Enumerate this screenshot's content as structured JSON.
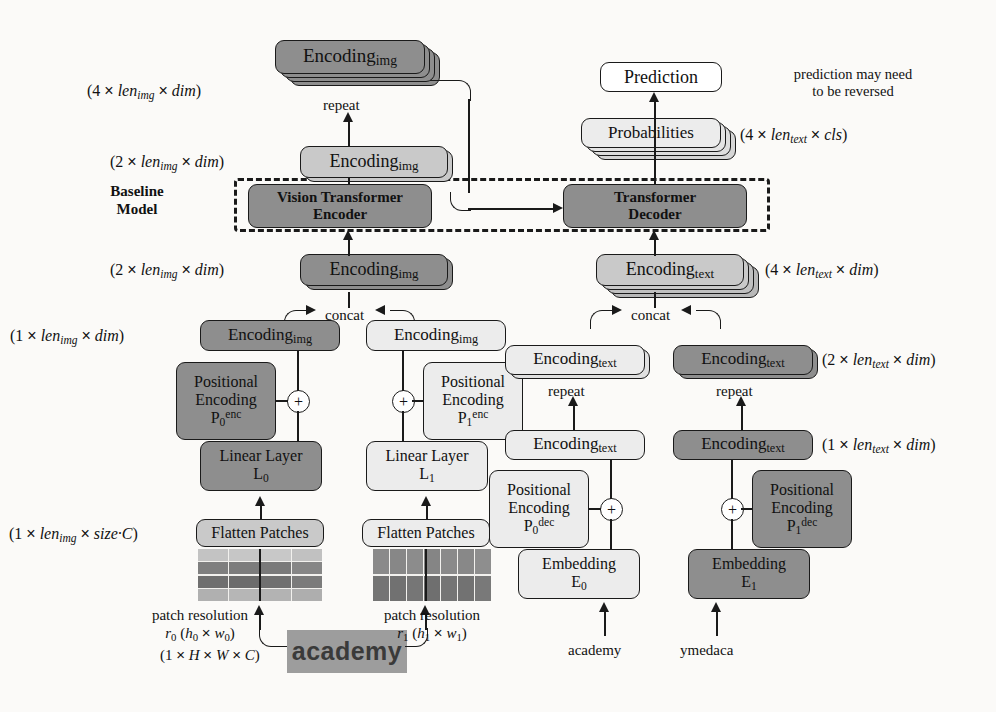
{
  "diagram": {
    "baseline_label_line1": "Baseline",
    "baseline_label_line2": "Model",
    "note_line1": "prediction may need",
    "note_line2": "to be reversed",
    "colors": {
      "dark": "#8e8e8e",
      "mid": "#c9c9c9",
      "light": "#ececec",
      "white": "#ffffff",
      "stroke": "#1a1a1a"
    }
  },
  "boxes": {
    "enc_img_4x": "Encodingimg",
    "enc_img_2x_top": "Encodingimg",
    "vision_transformer_encoder_l1": "Vision Transformer",
    "vision_transformer_encoder_l2": "Encoder",
    "transformer_decoder_l1": "Transformer",
    "transformer_decoder_l2": "Decoder",
    "prediction": "Prediction",
    "probabilities": "Probabilities",
    "enc_img_2x_bottom": "Encodingimg",
    "enc_text_4x": "Encodingtext",
    "enc_img_1x_left": "Encodingimg",
    "enc_img_1x_right": "Encodingimg",
    "enc_text_2x_left": "Encodingtext",
    "enc_text_2x_right": "Encodingtext",
    "enc_text_1x_left": "Encodingtext",
    "enc_text_1x_right": "Encodingtext",
    "pos_enc_0_l1": "Positional",
    "pos_enc_0_l2": "Encoding",
    "pos_enc_0_l3": "P0enc",
    "pos_enc_1_l1": "Positional",
    "pos_enc_1_l2": "Encoding",
    "pos_enc_1_l3": "P1enc",
    "pos_dec_0_l1": "Positional",
    "pos_dec_0_l2": "Encoding",
    "pos_dec_0_l3": "P0dec",
    "pos_dec_1_l1": "Positional",
    "pos_dec_1_l2": "Encoding",
    "pos_dec_1_l3": "P1dec",
    "linear_layer_0_l1": "Linear Layer",
    "linear_layer_0_l2": "L0",
    "linear_layer_1_l1": "Linear Layer",
    "linear_layer_1_l2": "L1",
    "flatten_patches_0": "Flatten Patches",
    "flatten_patches_1": "Flatten Patches",
    "embedding_0_l1": "Embedding",
    "embedding_0_l2": "E0",
    "embedding_1_l1": "Embedding",
    "embedding_1_l2": "E1"
  },
  "shape_labels": {
    "img_4x": "(4 x lenimg x dim)",
    "img_2x_top": "(2 x lenimg x dim)",
    "img_2x_bottom": "(2 x lenimg x dim)",
    "img_1x": "(1 x lenimg x dim)",
    "img_flat": "(1 x lenimg x size·C)",
    "img_raw": "(1 x H x W x C)",
    "prob_4x": "(4 x lentext x cls)",
    "text_4x": "(4 x lentext x dim)",
    "text_2x": "(2 x lentext x dim)",
    "text_1x": "(1 x lentext x dim)"
  },
  "op_labels": {
    "repeat_img": "repeat",
    "repeat_text_left": "repeat",
    "repeat_text_right": "repeat",
    "concat_img": "concat",
    "concat_text": "concat",
    "plus_enc_0": "+",
    "plus_enc_1": "+",
    "plus_dec_0": "+",
    "plus_dec_1": "+"
  },
  "captions": {
    "patch_res_0_l1": "patch resolution",
    "patch_res_0_l2": "r0 (h0 x w0)",
    "patch_res_1_l1": "patch resolution",
    "patch_res_1_l2": "r1 (h1 x w1)",
    "input_text_0": "academy",
    "input_text_1": "ymedaca",
    "source_image_text": "academy",
    "patch_text_0": "academy",
    "patch_text_1": "academy"
  }
}
